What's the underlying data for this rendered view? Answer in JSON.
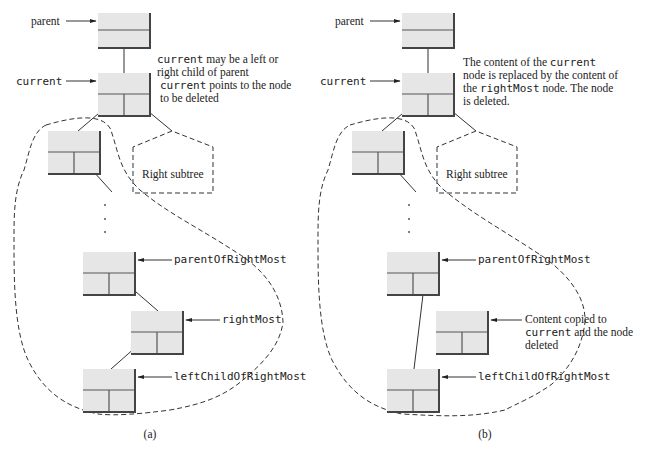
{
  "panel_a": {
    "label": "(a)",
    "parent_label": "parent",
    "current_label": "current",
    "note_current_child": {
      "code": "current",
      "text1": " may be a left or",
      "text2": "right child of parent"
    },
    "note_current_points": {
      "code": "current",
      "text1": " points to the node",
      "text2": "to be deleted"
    },
    "right_subtree": "Right subtree",
    "parent_of_right_most": "parentOfRightMost",
    "right_most": "rightMost",
    "left_child_of_right_most": "leftChildOfRightMost"
  },
  "panel_b": {
    "label": "(b)",
    "parent_label": "parent",
    "current_label": "current",
    "note_replaced": {
      "line1_text": "The content of the ",
      "line1_code": "current",
      "line2": "node is replaced by the content of",
      "line3_text1": "the ",
      "line3_code": "rightMost",
      "line3_text2": " node. The node",
      "line4": "is deleted."
    },
    "right_subtree": "Right subtree",
    "parent_of_right_most": "parentOfRightMost",
    "content_copied": {
      "line1": "Content copied to",
      "line2_code": "current",
      "line2_text": " and the node",
      "line3": "deleted"
    },
    "left_child_of_right_most": "leftChildOfRightMost"
  },
  "colors": {
    "node_fill": "#e6e6e6",
    "node_border": "#555555",
    "line": "#333333"
  }
}
